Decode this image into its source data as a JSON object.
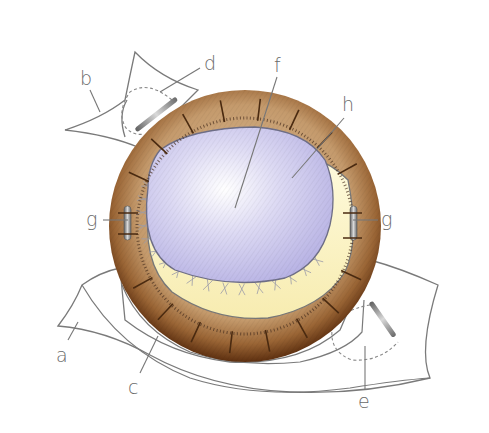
{
  "diagram": {
    "title": "",
    "labels": [
      {
        "id": "a",
        "text": "a",
        "target": "lower-left-flap"
      },
      {
        "id": "b",
        "text": "b",
        "target": "upper-left-flap"
      },
      {
        "id": "c",
        "text": "c",
        "target": "lower-incision-line"
      },
      {
        "id": "d",
        "text": "d",
        "target": "upper-pocket-implant"
      },
      {
        "id": "e",
        "text": "e",
        "target": "lower-pocket-implant"
      },
      {
        "id": "f",
        "text": "f",
        "target": "center-of-membrane"
      },
      {
        "id": "g_left",
        "text": "g",
        "target": "left-rod-fixation"
      },
      {
        "id": "g_right",
        "text": "g",
        "target": "right-rod-fixation"
      },
      {
        "id": "h",
        "text": "h",
        "target": "membrane-layer"
      }
    ],
    "colors": {
      "rim_dark": "#6b3a14",
      "rim_mid": "#a5703e",
      "rim_light": "#d4b088",
      "membrane": "#c8c4ec",
      "membrane_light": "#f1f0fb",
      "yellow_zone": "#fbf5c4",
      "outline": "#7a7a7a",
      "rod": "#9a9a9a"
    }
  }
}
